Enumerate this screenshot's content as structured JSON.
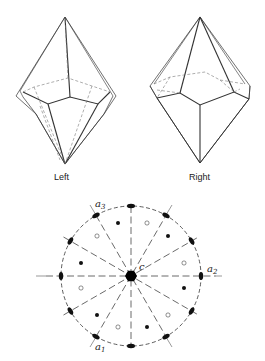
{
  "figure": {
    "crystals": [
      {
        "id": "left",
        "label": "Left"
      },
      {
        "id": "right",
        "label": "Right"
      }
    ],
    "stereogram": {
      "axes": {
        "a1": {
          "base": "a",
          "sub": "1"
        },
        "a2": {
          "base": "a",
          "sub": "2"
        },
        "a3": {
          "base": "a",
          "sub": "3"
        },
        "c": "c"
      },
      "legend": {
        "filled_dot": "upper-hemisphere pole",
        "open_dot": "lower-hemisphere pole",
        "lozenge": "two-fold axis",
        "center_hexagon": "six-fold axis"
      }
    }
  }
}
